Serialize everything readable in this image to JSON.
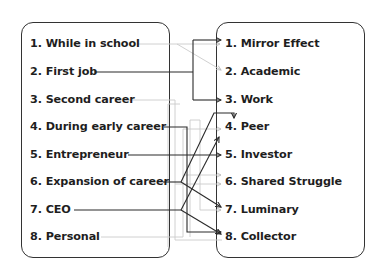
{
  "diagram": {
    "left_items": [
      {
        "id": 1,
        "label": "1. While in school"
      },
      {
        "id": 2,
        "label": "2. First job"
      },
      {
        "id": 3,
        "label": "3. Second career"
      },
      {
        "id": 4,
        "label": "4. During early career"
      },
      {
        "id": 5,
        "label": "5. Entrepreneur"
      },
      {
        "id": 6,
        "label": "6. Expansion of career"
      },
      {
        "id": 7,
        "label": "7. CEO"
      },
      {
        "id": 8,
        "label": "8. Personal"
      }
    ],
    "right_items": [
      {
        "id": 1,
        "label": "1. Mirror Effect"
      },
      {
        "id": 2,
        "label": "2. Academic"
      },
      {
        "id": 3,
        "label": "3. Work"
      },
      {
        "id": 4,
        "label": "4. Peer"
      },
      {
        "id": 5,
        "label": "5. Investor"
      },
      {
        "id": 6,
        "label": "6. Shared Struggle"
      },
      {
        "id": 7,
        "label": "7. Luminary"
      },
      {
        "id": 8,
        "label": "8. Collector"
      }
    ],
    "connections": [
      {
        "from": 1,
        "to": [
          1,
          2
        ],
        "style": "light"
      },
      {
        "from": 2,
        "to": [
          1,
          3
        ],
        "style": "dark"
      },
      {
        "from": 3,
        "to": [
          6,
          8
        ],
        "style": "light"
      },
      {
        "from": 4,
        "to": [
          8
        ],
        "style": "dark"
      },
      {
        "from": 5,
        "to": [
          5
        ],
        "style": "dark"
      },
      {
        "from": 6,
        "to": [
          4,
          7
        ],
        "style": "dark"
      },
      {
        "from": 7,
        "to": [
          5,
          8
        ],
        "style": "dark"
      },
      {
        "from": 8,
        "to": [
          4,
          6,
          7
        ],
        "style": "light"
      }
    ],
    "colors": {
      "dark": "#2a2a2a",
      "light": "#c8c8c8",
      "border": "#333333",
      "text": "#1e1e1e"
    }
  }
}
